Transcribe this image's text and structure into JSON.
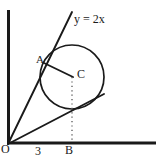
{
  "figure": {
    "type": "geometry-diagram",
    "background_color": "#ffffff",
    "stroke_color": "#1a1a1a",
    "canvas": {
      "width": 156,
      "height": 159
    }
  },
  "axes": {
    "x_axis": {
      "name": "x-axis",
      "from": {
        "x": 8,
        "y": 143
      },
      "to": {
        "x": 156,
        "y": 143
      },
      "thickness": 3
    },
    "y_axis": {
      "name": "y-axis",
      "from": {
        "x": 8,
        "y": 10
      },
      "to": {
        "x": 8,
        "y": 144
      },
      "thickness": 3
    },
    "origin": {
      "x": 8,
      "y": 144
    }
  },
  "labels": {
    "origin": "O",
    "x_tick_3": "3",
    "point_b": "B",
    "point_a": "A",
    "center_c": "C",
    "line_equation": "y = 2x"
  },
  "points": {
    "O": {
      "label": "O",
      "x": 8,
      "y": 144
    },
    "A": {
      "label": "A",
      "x": 44,
      "y": 63
    },
    "B": {
      "label": "B",
      "x": 72,
      "y": 143
    },
    "C": {
      "label": "C",
      "x": 72,
      "y": 77
    },
    "x_tick_3": {
      "label": "3",
      "x": 40,
      "y": 143
    }
  },
  "circle": {
    "name": "circle-C",
    "center": {
      "x": 72,
      "y": 77
    },
    "radius": 32,
    "fill": "none",
    "stroke": "#1a1a1a",
    "stroke_width": 1.6
  },
  "segments": [
    {
      "name": "line-y-equals-2x",
      "from": {
        "x": 8,
        "y": 144
      },
      "to": {
        "x": 72,
        "y": 12
      },
      "style": "solid",
      "stroke_width": 1.8
    },
    {
      "name": "segment-O-to-C-extended",
      "from": {
        "x": 8,
        "y": 144
      },
      "to": {
        "x": 104,
        "y": 94
      },
      "style": "solid",
      "stroke_width": 1.8
    },
    {
      "name": "segment-A-to-C",
      "from": {
        "x": 44,
        "y": 63
      },
      "to": {
        "x": 72,
        "y": 77
      },
      "style": "solid",
      "stroke_width": 1.8
    },
    {
      "name": "segment-C-to-B-dotted",
      "from": {
        "x": 72,
        "y": 77
      },
      "to": {
        "x": 72,
        "y": 143
      },
      "style": "dotted",
      "stroke_width": 1.2
    }
  ]
}
